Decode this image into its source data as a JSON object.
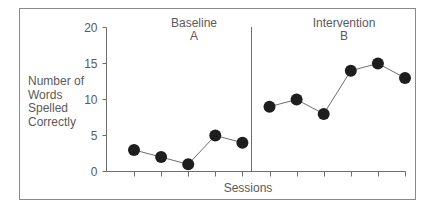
{
  "chart_data": {
    "type": "line",
    "title": "",
    "xlabel": "Sessions",
    "ylabel": "Number of Words Spelled Correctly",
    "ylabel_lines": [
      "Number of",
      "Words",
      "Spelled",
      "Correctly"
    ],
    "ylim": [
      0,
      20
    ],
    "yticks": [
      0,
      5,
      10,
      15,
      20
    ],
    "grid": false,
    "legend": null,
    "phases": [
      {
        "name": "Baseline",
        "label": "A",
        "sessions": [
          1,
          2,
          3,
          4,
          5
        ],
        "values": [
          3,
          2,
          1,
          5,
          4
        ]
      },
      {
        "name": "Intervention",
        "label": "B",
        "sessions": [
          6,
          7,
          8,
          9,
          10,
          11
        ],
        "values": [
          9,
          10,
          8,
          14,
          15,
          13
        ]
      }
    ],
    "x_tick_count": 11,
    "phase_change_after_session": 5
  },
  "colors": {
    "frame": "#8a8a8a",
    "axis": "#6e6e6e",
    "line": "#6e6e6e",
    "marker": "#1e1e1e",
    "text": "#5a5a5a"
  }
}
